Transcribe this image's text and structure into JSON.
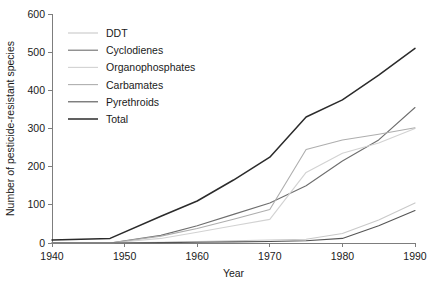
{
  "chart_data": {
    "type": "line",
    "title": "",
    "xlabel": "Year",
    "ylabel": "Number of pesticide-resistant species",
    "xlim": [
      1940,
      1990
    ],
    "ylim": [
      0,
      600
    ],
    "xticks": [
      1940,
      1950,
      1960,
      1970,
      1980,
      1990
    ],
    "yticks": [
      0,
      100,
      200,
      300,
      400,
      500,
      600
    ],
    "grid": false,
    "legend_position": "upper-left-inside",
    "x": [
      1940,
      1948,
      1955,
      1960,
      1965,
      1970,
      1975,
      1980,
      1985,
      1990
    ],
    "series": [
      {
        "name": "DDT",
        "color": "#c9c9c9",
        "values": [
          0,
          0,
          2,
          4,
          6,
          8,
          10,
          25,
          60,
          105
        ]
      },
      {
        "name": "Cyclodienes",
        "color": "#6e6e6e",
        "values": [
          0,
          0,
          20,
          45,
          75,
          105,
          150,
          215,
          270,
          355
        ]
      },
      {
        "name": "Organophosphates",
        "color": "#d2d2d2",
        "values": [
          0,
          0,
          12,
          28,
          45,
          62,
          185,
          235,
          262,
          300
        ]
      },
      {
        "name": "Carbamates",
        "color": "#aeaeae",
        "values": [
          0,
          0,
          18,
          38,
          62,
          88,
          245,
          270,
          285,
          302
        ]
      },
      {
        "name": "Pyrethroids",
        "color": "#555555",
        "values": [
          0,
          0,
          1,
          2,
          3,
          4,
          6,
          12,
          45,
          85
        ]
      },
      {
        "name": "Total",
        "color": "#2b2b2b",
        "values": [
          8,
          12,
          70,
          110,
          165,
          225,
          330,
          375,
          440,
          510
        ]
      }
    ]
  },
  "axes": {
    "x_title": "Year",
    "y_title": "Number of pesticide-resistant species",
    "x_tick_labels": [
      "1940",
      "1950",
      "1960",
      "1970",
      "1980",
      "1990"
    ],
    "y_tick_labels": [
      "0",
      "100",
      "200",
      "300",
      "400",
      "500",
      "600"
    ]
  },
  "legend": {
    "items": [
      {
        "label": "DDT"
      },
      {
        "label": "Cyclodienes"
      },
      {
        "label": "Organophosphates"
      },
      {
        "label": "Carbamates"
      },
      {
        "label": "Pyrethroids"
      },
      {
        "label": "Total"
      }
    ]
  }
}
